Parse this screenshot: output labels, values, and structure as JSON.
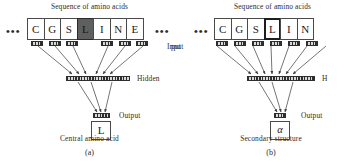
{
  "figure": {
    "width": 358,
    "height": 163,
    "line_color": "#3a3a3a",
    "highlight_color": "#5f5f5f"
  },
  "panels": [
    {
      "id": "a",
      "panel_letter": "(a)",
      "title": "Sequence of amino acids",
      "left_ellipsis": "•••",
      "right_ellipsis": "•••",
      "sequence": [
        "C",
        "G",
        "S",
        "L",
        "I",
        "N",
        "E"
      ],
      "central_index": 3,
      "central_style": "dark-filled",
      "input_unit_indices": [
        0,
        1,
        2,
        4,
        5,
        6
      ],
      "input_label": "Input",
      "hidden_label": "Hidden",
      "output_label": "Output",
      "output_value": "L",
      "bottom_label": "Central amino acid"
    },
    {
      "id": "b",
      "panel_letter": "(b)",
      "title": "Sequence of amino acids",
      "left_ellipsis": "•••",
      "right_ellipsis": "",
      "sequence": [
        "C",
        "G",
        "S",
        "L",
        "I",
        "N"
      ],
      "central_index": 3,
      "central_style": "bold-outline",
      "input_unit_indices": [
        0,
        1,
        2,
        3,
        4,
        5
      ],
      "input_label": "put",
      "hidden_label": "H",
      "output_label": "Output",
      "output_value": "α",
      "bottom_label": "Secondary structure"
    }
  ]
}
